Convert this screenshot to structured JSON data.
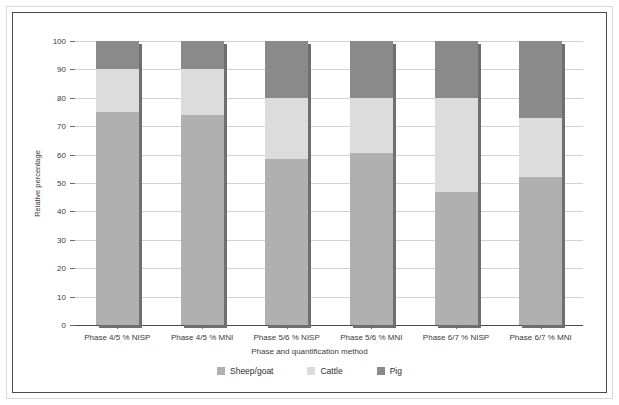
{
  "chart_data": {
    "type": "bar",
    "subtype": "stacked-bar-100",
    "title": "",
    "xlabel": "Phase and quantification method",
    "ylabel": "Relative percentage",
    "ylim": [
      0,
      100
    ],
    "yticks": [
      0,
      10,
      20,
      30,
      40,
      50,
      60,
      70,
      80,
      90,
      100
    ],
    "ytick_labels": [
      "0",
      "10",
      "20",
      "30",
      "40",
      "50",
      "60",
      "70",
      "80",
      "90",
      "100"
    ],
    "grid": true,
    "legend_position": "bottom",
    "categories": [
      "Phase 4/5 % NISP",
      "Phase 4/5 % MNI",
      "Phase 5/6 % NISP",
      "Phase 5/6 % MNI",
      "Phase 6/7 % NISP",
      "Phase 6/7 % MNI"
    ],
    "series": [
      {
        "name": "Sheep/goat",
        "color": "#b0b0b0",
        "values": [
          75,
          74,
          58.5,
          60.5,
          47,
          52
        ]
      },
      {
        "name": "Cattle",
        "color": "#dcdcdc",
        "values": [
          15,
          16,
          21.5,
          19.5,
          33,
          21
        ]
      },
      {
        "name": "Pig",
        "color": "#8a8a8a",
        "values": [
          10,
          10,
          20,
          20,
          20,
          27
        ]
      }
    ],
    "cumulative_tops": [
      [
        75,
        90,
        100
      ],
      [
        74,
        90,
        100
      ],
      [
        58.5,
        80,
        100
      ],
      [
        60.5,
        80,
        100
      ],
      [
        47,
        80,
        100
      ],
      [
        52,
        73,
        100
      ]
    ]
  },
  "legend": {
    "items": [
      {
        "label": "Sheep/goat",
        "swatch": "legend-swatch-sheep-goat"
      },
      {
        "label": "Cattle",
        "swatch": "legend-swatch-cattle"
      },
      {
        "label": "Pig",
        "swatch": "legend-swatch-pig"
      }
    ]
  },
  "colors": {
    "sheep_goat": "#b0b0b0",
    "cattle": "#dcdcdc",
    "pig": "#8a8a8a",
    "gridline": "#d2d2d2",
    "axis": "#4a4a4a",
    "text": "#3b3b3b",
    "frame_outer": "#2e2e2e"
  }
}
